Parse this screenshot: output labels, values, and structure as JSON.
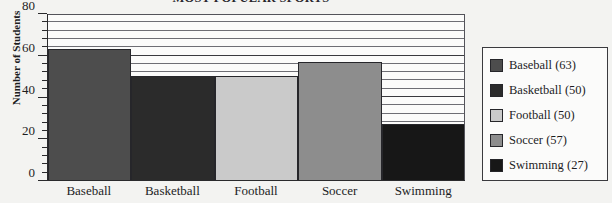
{
  "chart_data": {
    "type": "bar",
    "title": "MOST POPULAR SPORTS",
    "xlabel": "",
    "ylabel": "Number of Students",
    "categories": [
      "Baseball",
      "Basketball",
      "Football",
      "Soccer",
      "Swimming"
    ],
    "values": [
      63,
      50,
      50,
      57,
      27
    ],
    "ylim": [
      0,
      80
    ],
    "yticks": [
      0,
      20,
      40,
      60,
      80
    ],
    "ytick_labels": [
      "0",
      "20",
      "40",
      "60",
      "80"
    ],
    "minor_tick_step": 4,
    "grid": true,
    "grid_axis": "y",
    "legend_position": "right",
    "series": [
      {
        "name": "Baseball",
        "value": 63,
        "label": "Baseball (63)",
        "color": "#4d4d4d"
      },
      {
        "name": "Basketball",
        "value": 50,
        "label": "Basketball (50)",
        "color": "#2b2b2b"
      },
      {
        "name": "Football",
        "value": 50,
        "label": "Football (50)",
        "color": "#cacaca"
      },
      {
        "name": "Soccer",
        "value": 57,
        "label": "Soccer (57)",
        "color": "#8d8d8d"
      },
      {
        "name": "Swimming",
        "value": 27,
        "label": "Swimming (27)",
        "color": "#171717"
      }
    ]
  },
  "colors": {
    "background": "#f3f3f1",
    "plot_background": "#fbfbfa",
    "axis": "#2a2a2c",
    "gridline": "#6e6e74",
    "text": "#1d1d1f"
  }
}
